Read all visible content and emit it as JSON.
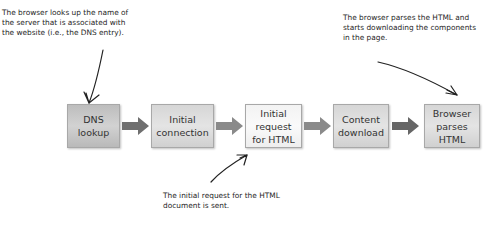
{
  "notes": {
    "dns": "The browser looks up the name of\nthe server that is associated with\nthe website (i.e., the DNS entry).",
    "parse": "The browser parses the HTML and\nstarts downloading the components\n in the page.",
    "request": "The initial request for the HTML\ndocument is sent."
  },
  "steps": [
    {
      "label": "DNS\nlookup"
    },
    {
      "label": "Initial\nconnection"
    },
    {
      "label": "Initial\nrequest\nfor HTML"
    },
    {
      "label": "Content\ndownload"
    },
    {
      "label": "Browser\nparses\nHTML"
    }
  ],
  "colors": {
    "arrow_dark": "#6f6f6f",
    "arrow_mid": "#8a8a8a",
    "box_border": "#a8a8a8"
  }
}
